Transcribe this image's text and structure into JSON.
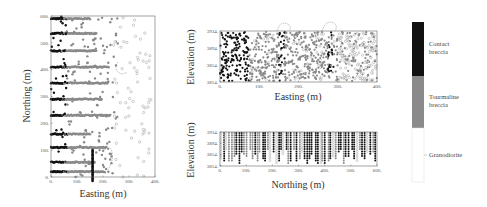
{
  "chart_data": [
    {
      "type": "scatter",
      "title": "",
      "xlabel": "Easting (m)",
      "ylabel": "Northing (m)",
      "xlim": [
        0,
        400
      ],
      "ylim": [
        0,
        600
      ],
      "xticks": [
        "0",
        "100",
        "200",
        "300",
        "400"
      ],
      "yticks": [
        "0",
        "100",
        "200",
        "300",
        "400",
        "500",
        "600"
      ],
      "grid": false,
      "series": [
        {
          "name": "Contact breccia",
          "color": "#111111",
          "description": "drill-hole samples concentrated at Easting 0-80 m along rows"
        },
        {
          "name": "Tourmaline breccia",
          "color": "#888888",
          "description": "rows of samples at Northing ~55,110,160,230,290,350,410,470,535,590"
        },
        {
          "name": "Granodiorite",
          "color": "#ffffff",
          "description": "scattered open circles mostly at Easting > 250 m"
        }
      ],
      "rows_northing": [
        590,
        535,
        470,
        410,
        350,
        290,
        230,
        160,
        110,
        55,
        20
      ]
    },
    {
      "type": "scatter",
      "title": "",
      "xlabel": "Easting (m)",
      "ylabel": "Elevation (m)",
      "xlim": [
        0,
        400
      ],
      "ylim": [
        3814,
        3934
      ],
      "xticks": [
        "0",
        "100",
        "200",
        "300",
        "400"
      ],
      "yticks": [
        "3934",
        "3894",
        "3854",
        "3814"
      ],
      "grid": false,
      "annotations": [
        "dashed arc at Easting ~160",
        "dashed arc at Easting ~285"
      ]
    },
    {
      "type": "scatter",
      "title": "",
      "xlabel": "Northing (m)",
      "ylabel": "Elevation (m)",
      "xlim": [
        0,
        600
      ],
      "ylim": [
        3814,
        3934
      ],
      "xticks": [
        "0",
        "100",
        "200",
        "300",
        "400",
        "500",
        "600"
      ],
      "yticks": [
        "3934",
        "3894",
        "3854",
        "3814"
      ],
      "grid": false
    }
  ],
  "legend": {
    "position": "right",
    "entries": [
      {
        "label_line1": "Contact",
        "label_line2": "breccia",
        "color": "#111111"
      },
      {
        "label_line1": "Tourmaline",
        "label_line2": "breccia",
        "color": "#8a8a8a"
      },
      {
        "label_line1": "Granodiorite",
        "label_line2": "",
        "color": "#ffffff"
      }
    ]
  },
  "plots": {
    "plan": {
      "xlabel": "Easting (m)",
      "ylabel": "Northing (m)",
      "xticks": [
        "0",
        "100",
        "200",
        "300",
        "400"
      ],
      "yticks": [
        "0",
        "100",
        "200",
        "300",
        "400",
        "500",
        "600"
      ]
    },
    "section_ew": {
      "xlabel": "Easting (m)",
      "ylabel": "Elevation (m)",
      "xticks": [
        "0",
        "100",
        "200",
        "300",
        "400"
      ],
      "yticks": [
        "3934",
        "3894",
        "3854",
        "3814"
      ]
    },
    "section_ns": {
      "xlabel": "Northing (m)",
      "ylabel": "Elevation (m)",
      "xticks": [
        "0",
        "100",
        "200",
        "300",
        "400",
        "500",
        "600"
      ],
      "yticks": [
        "3934",
        "3894",
        "3854",
        "3814"
      ]
    }
  }
}
